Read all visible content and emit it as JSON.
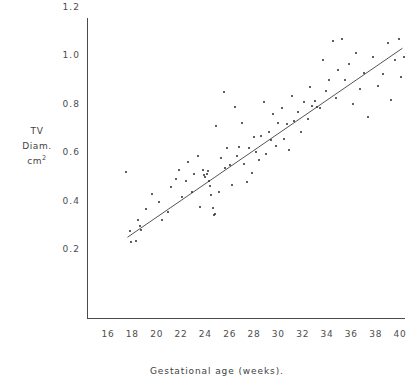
{
  "page": {
    "folio": "54",
    "running_header": "ASSESSMENT OF FOETAL BLADDER VOLUME GROWTH"
  },
  "chart_data": {
    "type": "scatter",
    "title": "",
    "xlabel": "Gestational age (weeks).",
    "ylabel_lines": [
      "TV",
      "Diam.",
      "cm"
    ],
    "ylabel_superscript": "2",
    "xlim": [
      14.6,
      40.9
    ],
    "ylim": [
      0.13,
      1.24
    ],
    "xticks": [
      16,
      18,
      20,
      22,
      24,
      26,
      28,
      30,
      32,
      34,
      36,
      38,
      40
    ],
    "yticks": [
      0.2,
      0.4,
      0.6,
      0.8,
      1.0,
      1.2
    ],
    "xtick_labels": [
      "16",
      "18",
      "20",
      "22",
      "24",
      "26",
      "28",
      "30",
      "32",
      "34",
      "36",
      "38",
      "40"
    ],
    "ytick_labels": [
      "0.2",
      "0.4",
      "0.6",
      "0.8",
      "1.0",
      "1.2"
    ],
    "grid": false,
    "legend": null,
    "marker_color": "#2a2a2a",
    "line_color": "#555555",
    "axis_color": "#4a4a4a",
    "fit_line": {
      "label": "regression line",
      "x_start": 17.6,
      "y_start": 0.327,
      "x_end": 40.2,
      "y_end": 1.108
    },
    "points": [
      [
        17.5,
        0.595
      ],
      [
        17.8,
        0.352
      ],
      [
        17.9,
        0.309
      ],
      [
        18.3,
        0.312
      ],
      [
        18.5,
        0.398
      ],
      [
        18.6,
        0.372
      ],
      [
        18.7,
        0.356
      ],
      [
        19.1,
        0.443
      ],
      [
        19.6,
        0.506
      ],
      [
        20.2,
        0.474
      ],
      [
        20.4,
        0.398
      ],
      [
        20.9,
        0.433
      ],
      [
        21.2,
        0.536
      ],
      [
        21.6,
        0.566
      ],
      [
        21.8,
        0.606
      ],
      [
        22.1,
        0.492
      ],
      [
        22.4,
        0.561
      ],
      [
        22.6,
        0.637
      ],
      [
        22.9,
        0.513
      ],
      [
        23.1,
        0.589
      ],
      [
        23.4,
        0.662
      ],
      [
        23.6,
        0.452
      ],
      [
        23.8,
        0.606
      ],
      [
        23.9,
        0.585
      ],
      [
        24.0,
        0.575
      ],
      [
        24.1,
        0.589
      ],
      [
        24.2,
        0.601
      ],
      [
        24.3,
        0.56
      ],
      [
        24.4,
        0.537
      ],
      [
        24.5,
        0.5
      ],
      [
        24.6,
        0.446
      ],
      [
        24.7,
        0.42
      ],
      [
        24.8,
        0.425
      ],
      [
        24.9,
        0.788
      ],
      [
        25.1,
        0.513
      ],
      [
        25.3,
        0.655
      ],
      [
        25.5,
        0.926
      ],
      [
        25.6,
        0.614
      ],
      [
        25.8,
        0.696
      ],
      [
        26.0,
        0.624
      ],
      [
        26.2,
        0.542
      ],
      [
        26.4,
        0.864
      ],
      [
        26.6,
        0.663
      ],
      [
        26.8,
        0.702
      ],
      [
        27.0,
        0.801
      ],
      [
        27.2,
        0.631
      ],
      [
        27.4,
        0.556
      ],
      [
        27.6,
        0.697
      ],
      [
        27.8,
        0.592
      ],
      [
        28.0,
        0.74
      ],
      [
        28.2,
        0.679
      ],
      [
        28.4,
        0.648
      ],
      [
        28.6,
        0.745
      ],
      [
        28.8,
        0.884
      ],
      [
        29.0,
        0.672
      ],
      [
        29.2,
        0.76
      ],
      [
        29.4,
        0.727
      ],
      [
        29.6,
        0.837
      ],
      [
        29.8,
        0.705
      ],
      [
        30.0,
        0.8
      ],
      [
        30.3,
        0.861
      ],
      [
        30.5,
        0.733
      ],
      [
        30.7,
        0.795
      ],
      [
        30.9,
        0.686
      ],
      [
        31.1,
        0.912
      ],
      [
        31.3,
        0.806
      ],
      [
        31.6,
        0.845
      ],
      [
        31.9,
        0.76
      ],
      [
        32.1,
        0.884
      ],
      [
        32.4,
        0.815
      ],
      [
        32.6,
        0.947
      ],
      [
        32.8,
        0.869
      ],
      [
        33.0,
        0.892
      ],
      [
        33.2,
        0.866
      ],
      [
        33.4,
        0.863
      ],
      [
        33.7,
        1.06
      ],
      [
        33.9,
        0.932
      ],
      [
        34.2,
        0.976
      ],
      [
        34.5,
        1.136
      ],
      [
        34.7,
        0.902
      ],
      [
        34.9,
        1.018
      ],
      [
        35.2,
        1.148
      ],
      [
        35.5,
        0.975
      ],
      [
        35.8,
        1.043
      ],
      [
        36.1,
        0.877
      ],
      [
        36.4,
        1.09
      ],
      [
        36.7,
        0.94
      ],
      [
        37.0,
        1.007
      ],
      [
        37.4,
        0.823
      ],
      [
        37.8,
        1.07
      ],
      [
        38.2,
        0.952
      ],
      [
        38.6,
        1.003
      ],
      [
        39.0,
        1.128
      ],
      [
        39.3,
        0.894
      ],
      [
        39.6,
        1.058
      ],
      [
        39.9,
        1.146
      ],
      [
        40.1,
        0.99
      ],
      [
        40.3,
        1.072
      ]
    ]
  }
}
